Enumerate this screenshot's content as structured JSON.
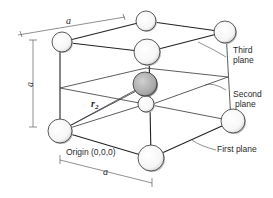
{
  "diagram": {
    "title": "",
    "type": "BCC unit cell with stacked planes",
    "labels": {
      "lattice_a_top": "a",
      "lattice_a_side": "a",
      "lattice_a_bottom": "a",
      "vector_r2": "r",
      "vector_r2_sub": "2",
      "origin": "Origin (0,0,0)",
      "third_plane_1": "Third",
      "third_plane_2": "plane",
      "second_plane_1": "Second",
      "second_plane_2": "plane",
      "first_plane": "First plane"
    },
    "atoms": [
      {
        "id": "top-left-back",
        "x": 62,
        "y": 42,
        "r": 10,
        "shaded": false
      },
      {
        "id": "top-back",
        "x": 146,
        "y": 21,
        "r": 10,
        "shaded": false
      },
      {
        "id": "top-right",
        "x": 225,
        "y": 32,
        "r": 11,
        "shaded": false
      },
      {
        "id": "top-front",
        "x": 147,
        "y": 52,
        "r": 13,
        "shaded": false
      },
      {
        "id": "body-center",
        "x": 145,
        "y": 84,
        "r": 12,
        "shaded": true
      },
      {
        "id": "below-center",
        "x": 146,
        "y": 104,
        "r": 8,
        "shaded": false
      },
      {
        "id": "origin",
        "x": 60,
        "y": 131,
        "r": 12,
        "shaded": false
      },
      {
        "id": "bottom-right",
        "x": 233,
        "y": 121,
        "r": 12,
        "shaded": false
      },
      {
        "id": "bottom-front",
        "x": 151,
        "y": 158,
        "r": 13,
        "shaded": false
      }
    ],
    "colors": {
      "line": "#222222",
      "atom_fill": "#ffffff",
      "atom_shaded": "#b8b8b8",
      "text": "#2a2a2a"
    }
  }
}
